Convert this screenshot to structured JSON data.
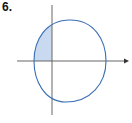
{
  "problem": {
    "number_label": "6."
  },
  "figure": {
    "type": "region-diagram",
    "colors": {
      "axis": "#555555",
      "curve": "#3a6fb5",
      "shade": "#c9daf0"
    },
    "shaded_region": "second quadrant, bounded by curve and axes"
  }
}
